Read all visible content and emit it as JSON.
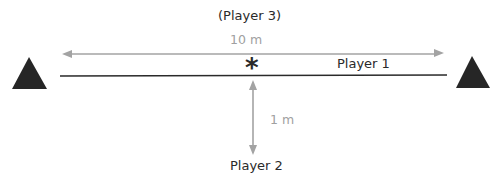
{
  "diagram": {
    "player3_label": "(Player 3)",
    "distance_horizontal": "10 m",
    "player1_label": "Player 1",
    "distance_vertical": "1 m",
    "player2_label": "Player 2",
    "marker_symbol": "*"
  },
  "colors": {
    "line": "#2a2a2a",
    "arrow": "#a3a3a3",
    "triangle": "#262626",
    "text": "#2a2a2a",
    "gray_text": "#a0a0a0"
  }
}
